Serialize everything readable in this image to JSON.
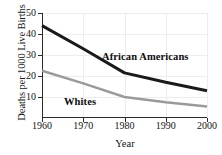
{
  "chart_data": {
    "type": "line",
    "title": "",
    "xlabel": "Year",
    "ylabel": "Deaths per 1000 Live Births",
    "x": [
      1960,
      1970,
      1980,
      1990,
      2000
    ],
    "xtick_labels": [
      "1960",
      "1970",
      "1980",
      "1990",
      "2000"
    ],
    "ytick_labels": [
      "10",
      "20",
      "30",
      "40",
      "50"
    ],
    "yticks": [
      10,
      20,
      30,
      40,
      50
    ],
    "xlim": [
      1960,
      2000
    ],
    "ylim": [
      0,
      50
    ],
    "grid": true,
    "legend": "inline-labels",
    "series": [
      {
        "name": "African Americans",
        "color": "#1a1a1a",
        "width": 3,
        "values": [
          44,
          33,
          21.5,
          17,
          13
        ]
      },
      {
        "name": "Whites",
        "color": "#9a9a9a",
        "width": 2.4,
        "values": [
          22.5,
          16.5,
          10,
          7.5,
          5.5
        ]
      }
    ],
    "annotations": [
      {
        "text": "African Americans",
        "series": "African Americans"
      },
      {
        "text": "Whites",
        "series": "Whites"
      }
    ]
  }
}
